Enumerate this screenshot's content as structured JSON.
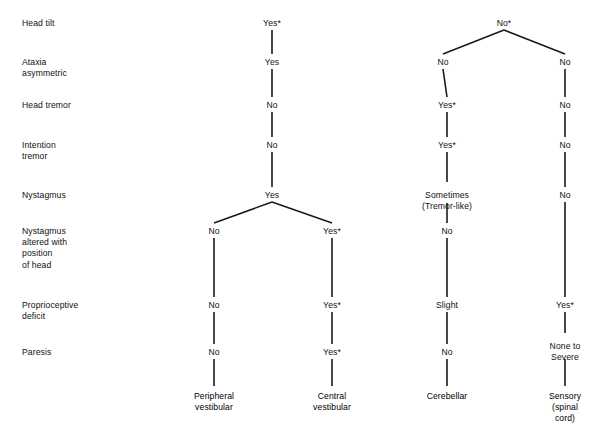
{
  "diagram": {
    "type": "decision-tree",
    "title": "",
    "row_labels": [
      {
        "text": "Head tilt",
        "y": 18
      },
      {
        "text": "Ataxia\nasymmetric",
        "y": 57
      },
      {
        "text": "Head tremor",
        "y": 100
      },
      {
        "text": "Intention\ntremor",
        "y": 140
      },
      {
        "text": "Nystagmus",
        "y": 190
      },
      {
        "text": "Nystagmus\naltered with\nposition\nof head",
        "y": 226
      },
      {
        "text": "Proprioceptive\ndeficit",
        "y": 300
      },
      {
        "text": "Paresis",
        "y": 347
      }
    ],
    "nodes": [
      {
        "id": "r1c1",
        "text": "Yes*",
        "x": 272,
        "y": 18
      },
      {
        "id": "r1c2",
        "text": "No*",
        "x": 504,
        "y": 18
      },
      {
        "id": "r2c1",
        "text": "Yes",
        "x": 272,
        "y": 57
      },
      {
        "id": "r2c2",
        "text": "No",
        "x": 443,
        "y": 57
      },
      {
        "id": "r2c3",
        "text": "No",
        "x": 565,
        "y": 57
      },
      {
        "id": "r3c1",
        "text": "No",
        "x": 272,
        "y": 100
      },
      {
        "id": "r3c2",
        "text": "Yes*",
        "x": 447,
        "y": 100
      },
      {
        "id": "r3c3",
        "text": "No",
        "x": 565,
        "y": 100
      },
      {
        "id": "r4c1",
        "text": "No",
        "x": 272,
        "y": 140
      },
      {
        "id": "r4c2",
        "text": "Yes*",
        "x": 447,
        "y": 140
      },
      {
        "id": "r4c3",
        "text": "No",
        "x": 565,
        "y": 140
      },
      {
        "id": "r5c1",
        "text": "Yes",
        "x": 272,
        "y": 190
      },
      {
        "id": "r5c2",
        "text": "Sometimes\n(Tremor-like)",
        "x": 447,
        "y": 190
      },
      {
        "id": "r5c3",
        "text": "No",
        "x": 565,
        "y": 190
      },
      {
        "id": "r6c1",
        "text": "No",
        "x": 214,
        "y": 226
      },
      {
        "id": "r6c2",
        "text": "Yes*",
        "x": 332,
        "y": 226
      },
      {
        "id": "r6c3",
        "text": "No",
        "x": 447,
        "y": 226
      },
      {
        "id": "r7c1",
        "text": "No",
        "x": 214,
        "y": 300
      },
      {
        "id": "r7c2",
        "text": "Yes*",
        "x": 332,
        "y": 300
      },
      {
        "id": "r7c3",
        "text": "Slight",
        "x": 447,
        "y": 300
      },
      {
        "id": "r7c4",
        "text": "Yes*",
        "x": 565,
        "y": 300
      },
      {
        "id": "r8c1",
        "text": "No",
        "x": 214,
        "y": 347
      },
      {
        "id": "r8c2",
        "text": "Yes*",
        "x": 332,
        "y": 347
      },
      {
        "id": "r8c3",
        "text": "No",
        "x": 447,
        "y": 347
      },
      {
        "id": "r8c4",
        "text": "None to\nSevere",
        "x": 565,
        "y": 341
      }
    ],
    "outcomes": [
      {
        "id": "out1",
        "text": "Peripheral\nvestibular",
        "x": 214,
        "y": 391
      },
      {
        "id": "out2",
        "text": "Central\nvestibular",
        "x": 332,
        "y": 391
      },
      {
        "id": "out3",
        "text": "Cerebellar",
        "x": 447,
        "y": 391
      },
      {
        "id": "out4",
        "text": "Sensory\n(spinal cord)",
        "x": 565,
        "y": 391
      }
    ],
    "links": [
      {
        "x1": 272,
        "y1": 30,
        "x2": 272,
        "y2": 54
      },
      {
        "x1": 272,
        "y1": 69,
        "x2": 272,
        "y2": 97
      },
      {
        "x1": 272,
        "y1": 112,
        "x2": 272,
        "y2": 137
      },
      {
        "x1": 272,
        "y1": 152,
        "x2": 272,
        "y2": 187
      },
      {
        "x1": 272,
        "y1": 202,
        "x2": 214,
        "y2": 223
      },
      {
        "x1": 272,
        "y1": 202,
        "x2": 332,
        "y2": 223
      },
      {
        "x1": 214,
        "y1": 238,
        "x2": 214,
        "y2": 297
      },
      {
        "x1": 332,
        "y1": 238,
        "x2": 332,
        "y2": 297
      },
      {
        "x1": 214,
        "y1": 312,
        "x2": 214,
        "y2": 344
      },
      {
        "x1": 332,
        "y1": 312,
        "x2": 332,
        "y2": 344
      },
      {
        "x1": 214,
        "y1": 359,
        "x2": 214,
        "y2": 386
      },
      {
        "x1": 332,
        "y1": 359,
        "x2": 332,
        "y2": 386
      },
      {
        "x1": 504,
        "y1": 30,
        "x2": 443,
        "y2": 54
      },
      {
        "x1": 504,
        "y1": 30,
        "x2": 565,
        "y2": 54
      },
      {
        "x1": 443,
        "y1": 69,
        "x2": 447,
        "y2": 97
      },
      {
        "x1": 447,
        "y1": 112,
        "x2": 447,
        "y2": 137
      },
      {
        "x1": 447,
        "y1": 152,
        "x2": 447,
        "y2": 182
      },
      {
        "x1": 447,
        "y1": 203,
        "x2": 447,
        "y2": 223
      },
      {
        "x1": 447,
        "y1": 238,
        "x2": 447,
        "y2": 297
      },
      {
        "x1": 447,
        "y1": 312,
        "x2": 447,
        "y2": 344
      },
      {
        "x1": 447,
        "y1": 359,
        "x2": 447,
        "y2": 386
      },
      {
        "x1": 565,
        "y1": 69,
        "x2": 565,
        "y2": 97
      },
      {
        "x1": 565,
        "y1": 112,
        "x2": 565,
        "y2": 137
      },
      {
        "x1": 565,
        "y1": 152,
        "x2": 565,
        "y2": 187
      },
      {
        "x1": 565,
        "y1": 202,
        "x2": 565,
        "y2": 297
      },
      {
        "x1": 565,
        "y1": 312,
        "x2": 565,
        "y2": 333
      },
      {
        "x1": 565,
        "y1": 359,
        "x2": 565,
        "y2": 386
      }
    ]
  }
}
